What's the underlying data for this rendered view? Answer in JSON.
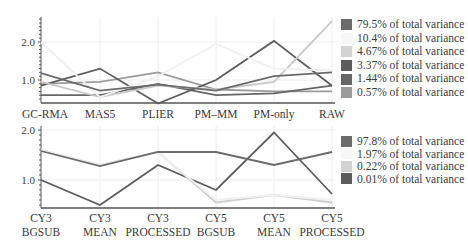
{
  "chart_data": [
    {
      "type": "line",
      "title": "",
      "xlabel": "",
      "ylabel": "",
      "categories": [
        "GC-RMA",
        "MAS5",
        "PLIER",
        "PM–MM",
        "PM-only",
        "RAW"
      ],
      "yticks": [
        "2.0",
        "1.0"
      ],
      "ylim": [
        0.4,
        2.6
      ],
      "grid": true,
      "legend_position": "right",
      "series": [
        {
          "name": "79.5% of total variance",
          "color": "#6b6b6b",
          "values": [
            1.18,
            0.72,
            0.88,
            0.72,
            1.1,
            1.2
          ]
        },
        {
          "name": "10.4% of total variance",
          "color": "#f0f0f0",
          "values": [
            2.0,
            0.55,
            1.1,
            1.95,
            1.3,
            1.25
          ]
        },
        {
          "name": "4.67% of total variance",
          "color": "#c9c9c9",
          "values": [
            0.95,
            0.55,
            0.85,
            0.75,
            0.95,
            2.55
          ]
        },
        {
          "name": "3.37% of total variance",
          "color": "#5c5c5c",
          "values": [
            0.85,
            1.3,
            0.38,
            1.0,
            2.03,
            0.85
          ]
        },
        {
          "name": "1.44% of total variance",
          "color": "#666666",
          "values": [
            0.6,
            0.6,
            0.9,
            0.6,
            0.65,
            0.85
          ]
        },
        {
          "name": "0.57% of total variance",
          "color": "#9b9b9b",
          "values": [
            0.9,
            0.95,
            1.2,
            0.75,
            0.7,
            0.7
          ]
        }
      ]
    },
    {
      "type": "line",
      "title": "",
      "xlabel": "",
      "ylabel": "",
      "categories": [
        "CY3 BGSUB",
        "CY3 MEAN",
        "CY3 PROCESSED",
        "CY5 BGSUB",
        "CY5 MEAN",
        "CY5 PROCESSED"
      ],
      "yticks": [
        "2.0",
        "1.0"
      ],
      "ylim": [
        0.44,
        2.1
      ],
      "grid": true,
      "legend_position": "right",
      "series": [
        {
          "name": "97.8% of total variance",
          "color": "#6b6b6b",
          "values": [
            1.58,
            1.28,
            1.56,
            1.56,
            1.3,
            1.56
          ]
        },
        {
          "name": "1.97% of total variance",
          "color": "#f0f0f0",
          "values": [
            1.6,
            1.3,
            1.55,
            0.6,
            0.7,
            0.6
          ]
        },
        {
          "name": "0.22% of total variance",
          "color": "#cfcfcf",
          "values": [
            1.6,
            1.3,
            1.56,
            0.55,
            0.7,
            0.55
          ]
        },
        {
          "name": "0.01% of total variance",
          "color": "#5c5c5c",
          "values": [
            1.0,
            0.5,
            1.3,
            0.8,
            1.95,
            0.72
          ]
        }
      ]
    }
  ],
  "top": {
    "yticks": [
      "2.0",
      "1.0"
    ],
    "categories": [
      "GC-RMA",
      "MAS5",
      "PLIER",
      "PM–MM",
      "PM-only",
      "RAW"
    ],
    "legend": [
      "79.5% of total variance",
      "10.4% of total variance",
      "4.67% of total variance",
      "3.37% of total variance",
      "1.44% of total variance",
      "0.57% of total variance"
    ]
  },
  "bottom": {
    "yticks": [
      "2.0",
      "1.0"
    ],
    "categories_line1": [
      "CY3",
      "CY3",
      "CY3",
      "CY5",
      "CY5",
      "CY5"
    ],
    "categories_line2": [
      "BGSUB",
      "MEAN",
      "PROCESSED",
      "BGSUB",
      "MEAN",
      "PROCESSED"
    ],
    "legend": [
      "97.8% of total variance",
      "1.97% of total variance",
      "0.22% of total variance",
      "0.01% of total variance"
    ]
  }
}
